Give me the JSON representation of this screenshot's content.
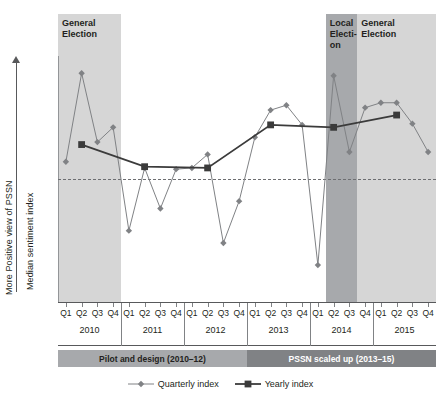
{
  "axis": {
    "y_direction_label": "More Positive view of PSSN",
    "y_title": "Median sentiment index",
    "arrow_up_icon": "up-arrow-icon"
  },
  "bands": [
    {
      "id": "general-election-2010",
      "label": "General\nElection",
      "tone": "light",
      "start_q": 1,
      "end_q": 4
    },
    {
      "id": "local-election-2014",
      "label": "Local\nElecti-\non",
      "tone": "dark",
      "start_q": 18,
      "end_q": 20
    },
    {
      "id": "general-election-2015",
      "label": "General\nElection",
      "tone": "light",
      "start_q": 20,
      "end_q": 24
    }
  ],
  "phases": [
    {
      "label": "Pilot and design (2010–12)",
      "tone": "a"
    },
    {
      "label": "PSSN scaled up (2013–15)",
      "tone": "b"
    }
  ],
  "legend": [
    {
      "label": "Quarterly index",
      "marker": "diamond",
      "color": "#808285"
    },
    {
      "label": "Yearly index",
      "marker": "square",
      "color": "#3b3b3b"
    }
  ],
  "colors": {
    "quarterly": "#808285",
    "yearly": "#3b3b3b",
    "band_light": "#d6d6d6",
    "band_dark": "#a7a9ac",
    "phase_light": "#a7a9ac",
    "phase_dark": "#808285",
    "axis": "#58595b"
  },
  "chart_data": {
    "type": "line",
    "xlabel": "",
    "ylabel": "Median sentiment index",
    "grid": false,
    "legend_position": "bottom",
    "zero_reference_line": 0,
    "ylim": [
      -1.0,
      1.0
    ],
    "years": [
      "2010",
      "2011",
      "2012",
      "2013",
      "2014",
      "2015"
    ],
    "quarters": [
      "Q1",
      "Q2",
      "Q3",
      "Q4"
    ],
    "categories": [
      "2010 Q1",
      "2010 Q2",
      "2010 Q3",
      "2010 Q4",
      "2011 Q1",
      "2011 Q2",
      "2011 Q3",
      "2011 Q4",
      "2012 Q1",
      "2012 Q2",
      "2012 Q3",
      "2012 Q4",
      "2013 Q1",
      "2013 Q2",
      "2013 Q3",
      "2013 Q4",
      "2014 Q1",
      "2014 Q2",
      "2014 Q3",
      "2014 Q4",
      "2015 Q1",
      "2015 Q2",
      "2015 Q3",
      "2015 Q4"
    ],
    "series": [
      {
        "name": "Quarterly index",
        "marker": "diamond",
        "color": "#808285",
        "values": [
          0.14,
          0.86,
          0.3,
          0.42,
          -0.42,
          0.09,
          -0.24,
          0.08,
          0.09,
          0.2,
          -0.52,
          -0.18,
          0.34,
          0.56,
          0.6,
          0.44,
          -0.7,
          0.84,
          0.22,
          0.58,
          0.62,
          0.62,
          0.45,
          0.22
        ]
      },
      {
        "name": "Yearly index",
        "marker": "square",
        "color": "#3b3b3b",
        "values": [
          null,
          0.28,
          null,
          null,
          null,
          0.1,
          null,
          null,
          null,
          0.09,
          null,
          null,
          null,
          0.44,
          null,
          null,
          null,
          0.42,
          null,
          null,
          null,
          0.52,
          null,
          null
        ]
      }
    ]
  }
}
